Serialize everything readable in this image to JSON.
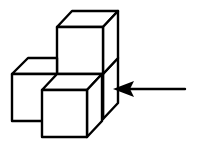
{
  "figure": {
    "type": "isometric-cube-assembly",
    "cube_count": 4,
    "cubes": [
      {
        "id": "rear-bottom",
        "position": "back column, bottom"
      },
      {
        "id": "top",
        "position": "back column, stacked on top"
      },
      {
        "id": "left",
        "position": "left, bottom"
      },
      {
        "id": "front",
        "position": "front, bottom"
      }
    ],
    "arrow": {
      "direction": "pointing-left",
      "target": "right side of assembly",
      "meaning": "viewing direction"
    },
    "colors": {
      "stroke": "#000000",
      "fill": "#ffffff",
      "background": "#ffffff"
    }
  }
}
